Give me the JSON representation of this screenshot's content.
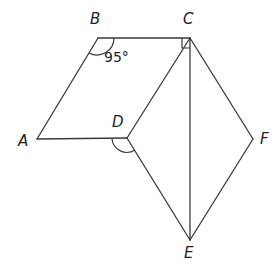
{
  "diagram": {
    "type": "geometry-figure",
    "points": {
      "A": {
        "label": "A",
        "x": 37,
        "y": 139,
        "label_x": 18,
        "label_y": 146
      },
      "B": {
        "label": "B",
        "x": 98,
        "y": 38,
        "label_x": 90,
        "label_y": 24
      },
      "C": {
        "label": "C",
        "x": 190,
        "y": 38,
        "label_x": 183,
        "label_y": 24
      },
      "D": {
        "label": "D",
        "x": 127,
        "y": 138,
        "label_x": 112,
        "label_y": 127
      },
      "E": {
        "label": "E",
        "x": 190,
        "y": 240,
        "label_x": 184,
        "label_y": 258
      },
      "F": {
        "label": "F",
        "x": 253,
        "y": 139,
        "label_x": 260,
        "label_y": 144
      }
    },
    "segments": [
      [
        "A",
        "B"
      ],
      [
        "B",
        "C"
      ],
      [
        "A",
        "D"
      ],
      [
        "C",
        "D"
      ],
      [
        "D",
        "E"
      ],
      [
        "C",
        "E"
      ],
      [
        "C",
        "F"
      ],
      [
        "F",
        "E"
      ]
    ],
    "angle_markers": [
      {
        "vertex": "B",
        "kind": "arc",
        "label": "95°"
      },
      {
        "vertex": "C",
        "kind": "right-angle",
        "between": [
          "B",
          "E"
        ]
      },
      {
        "vertex": "D",
        "kind": "arc",
        "between": [
          "A",
          "E"
        ]
      }
    ],
    "angle_label_B": "95°"
  }
}
